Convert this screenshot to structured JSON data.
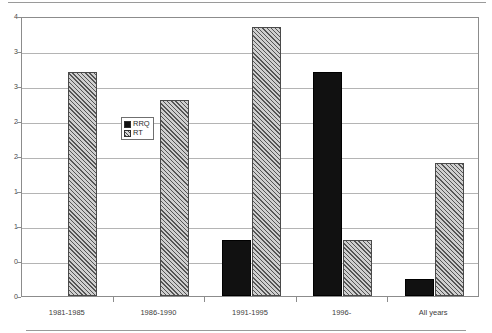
{
  "chart_data": {
    "type": "bar",
    "title": "",
    "subtitle": "",
    "xlabel": "",
    "ylabel": "",
    "ylim": [
      0,
      4
    ],
    "yticks": [
      0,
      0.5,
      1,
      1.5,
      2,
      2.5,
      3,
      3.5,
      4
    ],
    "ytick_labels": [
      "0",
      "1",
      "1",
      "2",
      "2",
      "3",
      "3",
      "4"
    ],
    "ytick_labels_full": [
      "0.0",
      "0.5",
      "1.0",
      "1.5",
      "2.0",
      "2.5",
      "3.0",
      "3.5",
      "4.0"
    ],
    "grid": true,
    "grid_axis": "y",
    "legend_position": "inside-upper-left",
    "categories": [
      "1981-1985",
      "1986-1990",
      "1991-1995",
      "1996-",
      "All years"
    ],
    "series": [
      {
        "name": "RRQ",
        "color": "#111111",
        "fill": "solid-black",
        "values": [
          0,
          0,
          0.8,
          3.2,
          0.25
        ]
      },
      {
        "name": "RT",
        "color": "#cfcfcf",
        "fill": "diagonal-hatch",
        "values": [
          3.2,
          2.8,
          3.85,
          0.8,
          1.9
        ]
      }
    ]
  },
  "legend": {
    "items": [
      {
        "label": "RRQ",
        "swatch": "solid-black-swatch"
      },
      {
        "label": "RT",
        "swatch": "hatched-swatch"
      }
    ]
  },
  "axes": {
    "y": {
      "labels": [
        "4",
        "3",
        "3",
        "2",
        "2",
        "1",
        "1",
        "0"
      ]
    },
    "x": {
      "labels": [
        "1981-1985",
        "1986-1990",
        "1991-1995",
        "1996-",
        "All years"
      ]
    }
  }
}
